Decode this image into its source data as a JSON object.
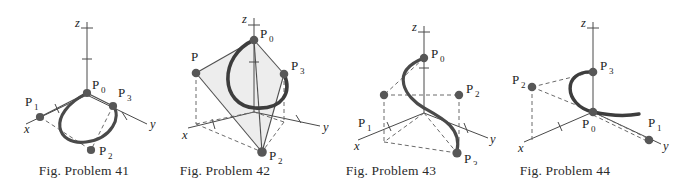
{
  "document": {
    "title": "Fig. Problem 41-44 — Bezier curve control polygons in 3D",
    "background_color": "#ffffff",
    "ink_color": "#2b2b2b",
    "curve_color": "#3d3d3d",
    "point_color": "#555555",
    "dash_color": "#6b6b6b",
    "plane_fill": "#ececec"
  },
  "figures": [
    {
      "id": "figure-41",
      "caption": "Fig. Problem 41",
      "axes": {
        "x": "x",
        "y": "y",
        "z": "z"
      },
      "points": [
        {
          "name": "P0",
          "base": "P",
          "sub": "0"
        },
        {
          "name": "P1",
          "base": "P",
          "sub": "1"
        },
        {
          "name": "P2",
          "base": "P",
          "sub": "2"
        },
        {
          "name": "P3",
          "base": "P",
          "sub": "3"
        }
      ]
    },
    {
      "id": "figure-42",
      "caption": "Fig. Problem 42",
      "axes": {
        "x": "x",
        "y": "y",
        "z": "z"
      },
      "points": [
        {
          "name": "P0",
          "base": "P",
          "sub": "0"
        },
        {
          "name": "P1",
          "base": "P",
          "sub": ""
        },
        {
          "name": "P2",
          "base": "P",
          "sub": "2"
        },
        {
          "name": "P3",
          "base": "P",
          "sub": "3"
        }
      ]
    },
    {
      "id": "figure-43",
      "caption": "Fig. Problem 43",
      "axes": {
        "x": "x",
        "y": "y",
        "z": "z"
      },
      "points": [
        {
          "name": "P0",
          "base": "P",
          "sub": "0"
        },
        {
          "name": "P1",
          "base": "P",
          "sub": "1"
        },
        {
          "name": "P2",
          "base": "P",
          "sub": "2"
        },
        {
          "name": "P3",
          "base": "P",
          "sub": "3"
        }
      ]
    },
    {
      "id": "figure-44",
      "caption": "Fig. Problem 44",
      "axes": {
        "x": "x",
        "y": "y",
        "z": "z"
      },
      "points": [
        {
          "name": "P0",
          "base": "P",
          "sub": "0"
        },
        {
          "name": "P1",
          "base": "P",
          "sub": "1"
        },
        {
          "name": "P2",
          "base": "P",
          "sub": "2"
        },
        {
          "name": "P3",
          "base": "P",
          "sub": "3"
        }
      ]
    }
  ],
  "fig41": {
    "caption": "Fig. Problem 41",
    "ax_x": "x",
    "ax_y": "y",
    "ax_z": "z",
    "p0": "P",
    "p0s": "0",
    "p1": "P",
    "p1s": "1",
    "p2": "P",
    "p2s": "2",
    "p3": "P",
    "p3s": "3"
  },
  "fig42": {
    "caption": "Fig. Problem 42",
    "ax_x": "x",
    "ax_y": "y",
    "ax_z": "z",
    "p0": "P",
    "p0s": "0",
    "p1": "P",
    "p1s": "",
    "p2": "P",
    "p2s": "2",
    "p3": "P",
    "p3s": "3"
  },
  "fig43": {
    "caption": "Fig. Problem 43",
    "ax_x": "x",
    "ax_y": "y",
    "ax_z": "z",
    "p0": "P",
    "p0s": "0",
    "p1": "P",
    "p1s": "1",
    "p2": "P",
    "p2s": "2",
    "p3": "P",
    "p3s": "3"
  },
  "fig44": {
    "caption": "Fig. Problem 44",
    "ax_x": "x",
    "ax_y": "y",
    "ax_z": "z",
    "p0": "P",
    "p0s": "0",
    "p1": "P",
    "p1s": "1",
    "p2": "P",
    "p2s": "2",
    "p3": "P",
    "p3s": "3"
  }
}
